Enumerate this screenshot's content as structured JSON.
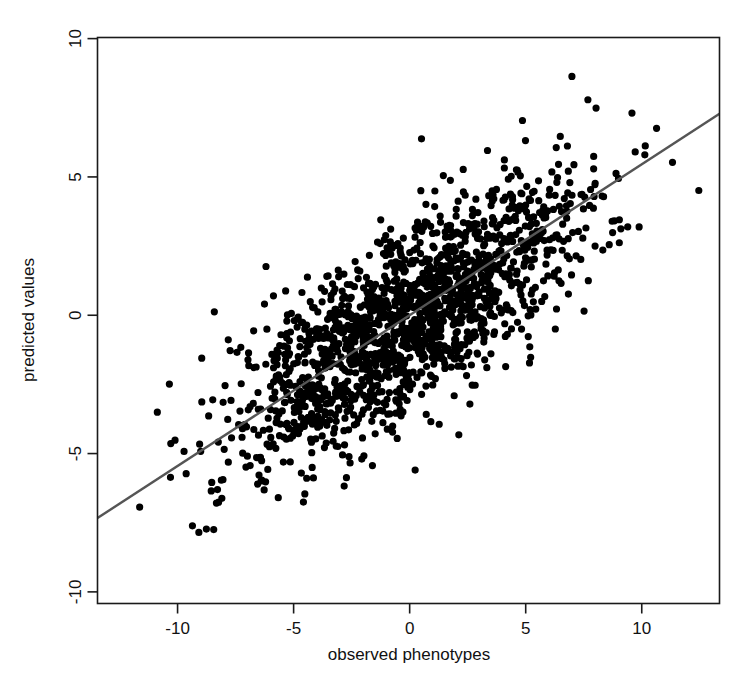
{
  "chart_data": {
    "type": "scatter",
    "title": "",
    "subtitle": "",
    "xlabel": "observed phenotypes",
    "ylabel": "predicted values",
    "xlim": [
      -13.45,
      13.35
    ],
    "ylim": [
      -10.42,
      10.04
    ],
    "xticks": [
      -10,
      -5,
      0,
      5,
      10
    ],
    "xtick_labels": [
      "-10",
      "-5",
      "0",
      "5",
      "10"
    ],
    "yticks": [
      -10,
      -5,
      0,
      5,
      10
    ],
    "ytick_labels": [
      "-10",
      "-5",
      "0",
      "5",
      "10"
    ],
    "grid": false,
    "legend": null,
    "point_color": "#000000",
    "point_marker": "filled-circle",
    "point_radius_px": 3.6,
    "n_points": 1700,
    "correlation": 0.75,
    "series": [
      {
        "name": "observations",
        "x_mean": 0.0,
        "y_mean": -0.2,
        "x_sd": 3.7,
        "y_sd": 2.55,
        "description": "dense elliptical cloud of black filled circles, positively correlated, centred near the origin"
      }
    ],
    "fit_line": {
      "name": "regression-line",
      "color": "#555555",
      "width_px": 2.4,
      "slope": 0.545,
      "intercept": 0.0,
      "x_start": -13.45,
      "y_start": -7.33,
      "x_end": 13.35,
      "y_end": 7.28
    },
    "annotations": []
  },
  "axes": {
    "x_title": "observed phenotypes",
    "y_title": "predicted values"
  },
  "colors": {
    "background": "#ffffff",
    "frame": "#1a1a1a",
    "points": "#000000",
    "fit_line": "#555555",
    "text": "#111111"
  }
}
